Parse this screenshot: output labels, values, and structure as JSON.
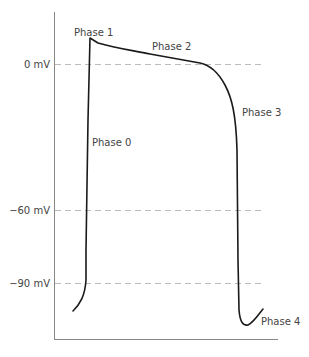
{
  "diagram": {
    "y_labels": [
      {
        "text": "0 mV",
        "y": 65
      },
      {
        "text": "−60 mV",
        "y": 211
      },
      {
        "text": "−90 mV",
        "y": 284
      }
    ],
    "phases": [
      {
        "label": "Phase 0",
        "x": 92,
        "y": 146
      },
      {
        "label": "Phase 1",
        "x": 74,
        "y": 36
      },
      {
        "label": "Phase 2",
        "x": 152,
        "y": 50
      },
      {
        "label": "Phase 3",
        "x": 242,
        "y": 116
      },
      {
        "label": "Phase 4",
        "x": 261,
        "y": 325
      }
    ],
    "colors": {
      "curve": "#1a1a1a",
      "axis": "#777777",
      "gridline": "#bbbbbb",
      "text": "#444444"
    }
  }
}
